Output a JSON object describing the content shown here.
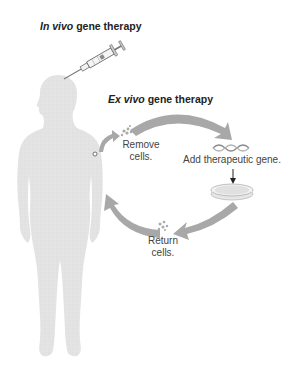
{
  "diagram": {
    "in_vivo_title": {
      "italic": "In vivo",
      "rest": " gene therapy"
    },
    "ex_vivo_title": {
      "italic": "Ex vivo",
      "rest": " gene therapy"
    },
    "steps": [
      {
        "id": "remove",
        "line1": "Remove",
        "line2": "cells."
      },
      {
        "id": "add",
        "line1": "Add therapeutic gene."
      },
      {
        "id": "return",
        "line1": "Return",
        "line2": "cells."
      }
    ],
    "icons": [
      "syringe-icon",
      "human-silhouette",
      "cells-cluster-icon",
      "dna-helix-icon",
      "petri-dish-icon",
      "down-arrow-icon",
      "cycle-arrow-icon"
    ],
    "colors": {
      "body": "#e2e2e2",
      "arrow": "#a9a9a9",
      "text": "#444444",
      "title": "#222222"
    }
  }
}
